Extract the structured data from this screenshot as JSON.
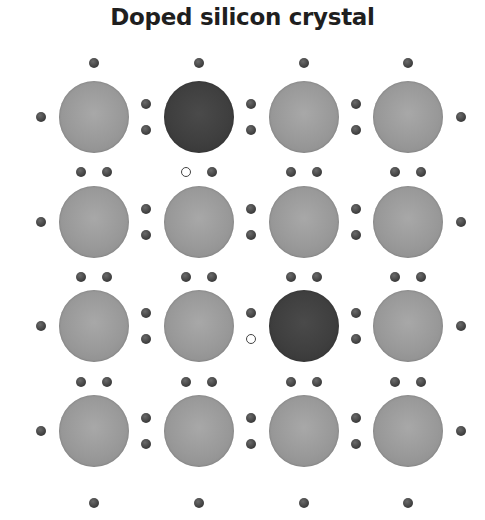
{
  "title": "Doped silicon crystal",
  "colors": {
    "silicon_atom": "#999999",
    "dopant_atom": "#3f3f3f",
    "electron": "#3b3b3b",
    "hole_outline": "#444444",
    "background": "#ffffff"
  },
  "lattice": {
    "rows": 4,
    "cols": 4,
    "atoms": [
      [
        "silicon",
        "dopant",
        "silicon",
        "silicon"
      ],
      [
        "silicon",
        "silicon",
        "silicon",
        "silicon"
      ],
      [
        "silicon",
        "silicon",
        "dopant",
        "silicon"
      ],
      [
        "silicon",
        "silicon",
        "silicon",
        "silicon"
      ]
    ],
    "holes": [
      {
        "description": "missing electron below dopant atom at row 1, column 2"
      },
      {
        "description": "missing electron left of dopant atom at row 3, column 3"
      }
    ]
  },
  "legend_icons": [
    "silicon-atom-icon",
    "dopant-atom-icon",
    "electron-icon",
    "hole-icon"
  ]
}
